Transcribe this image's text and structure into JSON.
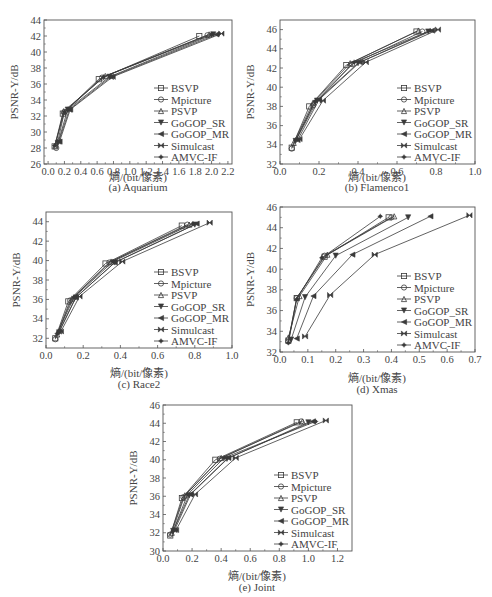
{
  "legend": [
    "BSVP",
    "Mpicture",
    "PSVP",
    "GoGOP_SR",
    "GoGOP_MR",
    "Simulcast",
    "AMVC-IF"
  ],
  "markers": [
    "square",
    "circle",
    "triangle",
    "triangle-down",
    "triangle-left",
    "bowtie",
    "star"
  ],
  "colors": {
    "line": "#3a3a3a",
    "frame": "#555555",
    "text": "#444444",
    "background": "#ffffff"
  },
  "chart_data": [
    {
      "id": "a",
      "type": "line",
      "title": "(a) Aquarium",
      "caption": "(a) Aquarium",
      "xlabel": "熵/(bit/像素)",
      "ylabel": "PSNR-Y/dB",
      "xlim": [
        -0.05,
        2.25
      ],
      "ylim": [
        26,
        44
      ],
      "xticks": [
        "0.0",
        "0.2",
        "0.4",
        "0.6",
        "0.8",
        "1.0",
        "1.2",
        "1.4",
        "1.6",
        "1.8",
        "2.0",
        "2.2"
      ],
      "yticks": [
        "26",
        "28",
        "30",
        "32",
        "34",
        "36",
        "38",
        "40",
        "42",
        "44"
      ],
      "grid": false,
      "legend_position": "lower right",
      "frame": {
        "left": 44,
        "top": 20,
        "right": 232,
        "bottom": 164
      },
      "series": [
        {
          "name": "BSVP",
          "x": [
            0.08,
            0.18,
            0.62,
            1.85
          ],
          "y": [
            28.2,
            32.3,
            36.6,
            42.0
          ]
        },
        {
          "name": "Mpicture",
          "x": [
            0.1,
            0.2,
            0.66,
            1.95
          ],
          "y": [
            28.0,
            32.5,
            36.8,
            42.1
          ]
        },
        {
          "name": "PSVP",
          "x": [
            0.09,
            0.19,
            0.7,
            1.97
          ],
          "y": [
            28.3,
            32.6,
            37.0,
            42.2
          ]
        },
        {
          "name": "GoGOP_SR",
          "x": [
            0.12,
            0.24,
            0.75,
            2.02
          ],
          "y": [
            28.6,
            32.8,
            36.9,
            42.2
          ]
        },
        {
          "name": "GoGOP_MR",
          "x": [
            0.13,
            0.26,
            0.77,
            2.06
          ],
          "y": [
            28.8,
            32.8,
            36.9,
            42.2
          ]
        },
        {
          "name": "Simulcast",
          "x": [
            0.14,
            0.27,
            0.79,
            2.12
          ],
          "y": [
            28.8,
            32.8,
            36.9,
            42.3
          ]
        },
        {
          "name": "AMVC-IF",
          "x": [
            0.08,
            0.2,
            0.68,
            2.0
          ],
          "y": [
            28.3,
            32.5,
            36.9,
            42.2
          ]
        }
      ]
    },
    {
      "id": "b",
      "type": "line",
      "title": "(b) Flamenco1",
      "caption": "(b) Flamenco1",
      "xlabel": "熵/(bit/像素)",
      "ylabel": "PSNR-Y/dB",
      "xlim": [
        0.0,
        1.0
      ],
      "ylim": [
        32,
        47
      ],
      "xticks": [
        "0.0",
        "0.2",
        "0.4",
        "0.6",
        "0.8",
        "1.0"
      ],
      "yticks": [
        "32",
        "34",
        "36",
        "38",
        "40",
        "42",
        "44",
        "46"
      ],
      "grid": false,
      "legend_position": "lower right",
      "frame": {
        "left": 280,
        "top": 20,
        "right": 475,
        "bottom": 164
      },
      "series": [
        {
          "name": "BSVP",
          "x": [
            0.06,
            0.15,
            0.34,
            0.7
          ],
          "y": [
            33.7,
            38.0,
            42.3,
            45.8
          ]
        },
        {
          "name": "Mpicture",
          "x": [
            0.06,
            0.17,
            0.37,
            0.73
          ],
          "y": [
            33.6,
            38.1,
            42.4,
            45.8
          ]
        },
        {
          "name": "PSVP",
          "x": [
            0.07,
            0.17,
            0.36,
            0.71
          ],
          "y": [
            34.2,
            38.4,
            42.5,
            45.9
          ]
        },
        {
          "name": "GoGOP_SR",
          "x": [
            0.08,
            0.19,
            0.4,
            0.76
          ],
          "y": [
            34.4,
            38.6,
            42.5,
            45.8
          ]
        },
        {
          "name": "GoGOP_MR",
          "x": [
            0.09,
            0.2,
            0.41,
            0.78
          ],
          "y": [
            34.5,
            38.7,
            42.6,
            45.9
          ]
        },
        {
          "name": "Simulcast",
          "x": [
            0.1,
            0.22,
            0.44,
            0.81
          ],
          "y": [
            34.6,
            38.6,
            42.6,
            46.0
          ]
        },
        {
          "name": "AMVC-IF",
          "x": [
            0.08,
            0.18,
            0.38,
            0.77
          ],
          "y": [
            34.5,
            38.5,
            42.6,
            45.9
          ]
        }
      ]
    },
    {
      "id": "c",
      "type": "line",
      "title": "(c) Race2",
      "caption": "(c) Race2",
      "xlabel": "熵/(bit/像素)",
      "ylabel": "PSNR-Y/dB",
      "xlim": [
        0.0,
        1.0
      ],
      "ylim": [
        31,
        45
      ],
      "xticks": [
        "0.0",
        "0.2",
        "0.4",
        "0.6",
        "0.8",
        "1.0"
      ],
      "yticks": [
        "32",
        "34",
        "36",
        "38",
        "40",
        "42",
        "44"
      ],
      "grid": false,
      "legend_position": "lower right",
      "frame": {
        "left": 46,
        "top": 212,
        "right": 232,
        "bottom": 348
      },
      "series": [
        {
          "name": "BSVP",
          "x": [
            0.05,
            0.12,
            0.32,
            0.73
          ],
          "y": [
            32.0,
            35.8,
            39.7,
            43.6
          ]
        },
        {
          "name": "Mpicture",
          "x": [
            0.05,
            0.13,
            0.34,
            0.76
          ],
          "y": [
            31.9,
            35.9,
            39.8,
            43.7
          ]
        },
        {
          "name": "PSVP",
          "x": [
            0.06,
            0.14,
            0.35,
            0.77
          ],
          "y": [
            32.4,
            36.1,
            39.9,
            43.7
          ]
        },
        {
          "name": "GoGOP_SR",
          "x": [
            0.07,
            0.16,
            0.37,
            0.8
          ],
          "y": [
            32.6,
            36.2,
            39.8,
            43.7
          ]
        },
        {
          "name": "GoGOP_MR",
          "x": [
            0.07,
            0.16,
            0.37,
            0.81
          ],
          "y": [
            32.7,
            36.2,
            39.8,
            43.8
          ]
        },
        {
          "name": "Simulcast",
          "x": [
            0.08,
            0.18,
            0.41,
            0.88
          ],
          "y": [
            32.7,
            36.3,
            39.9,
            43.9
          ]
        },
        {
          "name": "AMVC-IF",
          "x": [
            0.06,
            0.15,
            0.36,
            0.79
          ],
          "y": [
            32.5,
            36.2,
            39.9,
            43.8
          ]
        }
      ]
    },
    {
      "id": "d",
      "type": "line",
      "title": "(d) Xmas",
      "caption": "(d) Xmas",
      "xlabel": "熵/(bit/像素)",
      "ylabel": "PSNR-Y/dB",
      "xlim": [
        0.0,
        0.7
      ],
      "ylim": [
        32,
        46
      ],
      "xticks": [
        "0.0",
        "0.1",
        "0.2",
        "0.3",
        "0.4",
        "0.5",
        "0.6",
        "0.7"
      ],
      "yticks": [
        "32",
        "34",
        "36",
        "38",
        "40",
        "42",
        "44",
        "46"
      ],
      "grid": false,
      "legend_position": "lower right",
      "frame": {
        "left": 280,
        "top": 207,
        "right": 475,
        "bottom": 352
      },
      "series": [
        {
          "name": "BSVP",
          "x": [
            0.03,
            0.06,
            0.16,
            0.39
          ],
          "y": [
            33.1,
            37.2,
            41.2,
            45.0
          ]
        },
        {
          "name": "Mpicture",
          "x": [
            0.03,
            0.06,
            0.16,
            0.4
          ],
          "y": [
            33.0,
            37.2,
            41.3,
            45.0
          ]
        },
        {
          "name": "PSVP",
          "x": [
            0.03,
            0.07,
            0.17,
            0.41
          ],
          "y": [
            33.4,
            37.4,
            41.4,
            45.1
          ]
        },
        {
          "name": "GoGOP_SR",
          "x": [
            0.04,
            0.09,
            0.2,
            0.46
          ],
          "y": [
            33.2,
            37.3,
            41.3,
            45.0
          ]
        },
        {
          "name": "GoGOP_MR",
          "x": [
            0.06,
            0.12,
            0.26,
            0.54
          ],
          "y": [
            33.3,
            37.4,
            41.4,
            45.1
          ]
        },
        {
          "name": "Simulcast",
          "x": [
            0.09,
            0.18,
            0.34,
            0.68
          ],
          "y": [
            33.5,
            37.5,
            41.4,
            45.2
          ]
        },
        {
          "name": "AMVC-IF",
          "x": [
            0.03,
            0.06,
            0.15,
            0.36
          ],
          "y": [
            32.9,
            37.1,
            41.1,
            45.1
          ]
        }
      ]
    },
    {
      "id": "e",
      "type": "line",
      "title": "(e) Joint",
      "caption": "(e) Joint",
      "xlabel": "熵/(bit/像素)",
      "ylabel": "PSNR-Y/dB",
      "xlim": [
        0.0,
        1.3
      ],
      "ylim": [
        30,
        46
      ],
      "xticks": [
        "0.0",
        "0.2",
        "0.4",
        "0.6",
        "0.8",
        "1.0",
        "1.2"
      ],
      "yticks": [
        "30",
        "32",
        "34",
        "36",
        "38",
        "40",
        "42",
        "44",
        "46"
      ],
      "grid": false,
      "legend_position": "lower right",
      "frame": {
        "left": 163,
        "top": 405,
        "right": 352,
        "bottom": 551
      },
      "series": [
        {
          "name": "BSVP",
          "x": [
            0.05,
            0.13,
            0.36,
            0.92
          ],
          "y": [
            31.7,
            35.8,
            40.0,
            44.1
          ]
        },
        {
          "name": "Mpicture",
          "x": [
            0.05,
            0.14,
            0.39,
            0.95
          ],
          "y": [
            31.8,
            35.9,
            40.1,
            44.2
          ]
        },
        {
          "name": "PSVP",
          "x": [
            0.06,
            0.15,
            0.4,
            0.96
          ],
          "y": [
            32.0,
            36.1,
            40.2,
            44.2
          ]
        },
        {
          "name": "GoGOP_SR",
          "x": [
            0.07,
            0.18,
            0.44,
            1.0
          ],
          "y": [
            32.2,
            36.1,
            40.1,
            44.1
          ]
        },
        {
          "name": "GoGOP_MR",
          "x": [
            0.08,
            0.19,
            0.45,
            1.03
          ],
          "y": [
            32.3,
            36.2,
            40.2,
            44.2
          ]
        },
        {
          "name": "Simulcast",
          "x": [
            0.09,
            0.22,
            0.5,
            1.12
          ],
          "y": [
            32.3,
            36.2,
            40.2,
            44.3
          ]
        },
        {
          "name": "AMVC-IF",
          "x": [
            0.07,
            0.17,
            0.42,
            1.05
          ],
          "y": [
            32.2,
            36.2,
            40.2,
            44.2
          ]
        }
      ]
    }
  ]
}
